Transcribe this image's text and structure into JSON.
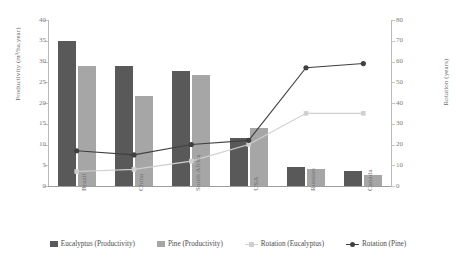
{
  "chart_data": {
    "type": "bar",
    "title": "",
    "subtitle": "",
    "categories": [
      "Brazil",
      "China",
      "South Africa",
      "USA",
      "Russian",
      "Canada"
    ],
    "xlabel": "",
    "ylabel": "Productivity (m³/ha.year)",
    "y2label": "Rotation (years)",
    "ylim": [
      0,
      40
    ],
    "y2lim": [
      0,
      80
    ],
    "yticks": [
      0,
      5,
      10,
      15,
      20,
      25,
      30,
      35,
      40
    ],
    "y2ticks": [
      0,
      10,
      20,
      30,
      40,
      50,
      60,
      70,
      80
    ],
    "grid": false,
    "legend_position": "bottom",
    "series": [
      {
        "name": "Eucalyptus (Productivity)",
        "kind": "bar",
        "axis": "left",
        "color": "#595959",
        "values": [
          35,
          28.8,
          27.8,
          11.6,
          4.7,
          3.6
        ]
      },
      {
        "name": "Pine (Productivity)",
        "kind": "bar",
        "axis": "left",
        "color": "#a6a6a6",
        "values": [
          28.8,
          21.8,
          26.7,
          13.9,
          4.2,
          2.6
        ]
      },
      {
        "name": "Rotation (Eucalyptus)",
        "kind": "line",
        "axis": "right",
        "color": "#d0d0d0",
        "marker": "square",
        "values": [
          7,
          8,
          12,
          20,
          35,
          35
        ]
      },
      {
        "name": "Rotation (Pine)",
        "kind": "line",
        "axis": "right",
        "color": "#404040",
        "marker": "circle",
        "values": [
          17,
          15,
          20,
          22,
          57,
          59
        ]
      }
    ]
  },
  "colors": {
    "eucalyptus_bar": "#595959",
    "pine_bar": "#a6a6a6",
    "rotation_eucalyptus_line": "#d0d0d0",
    "rotation_pine_line": "#404040",
    "axis": "#b9b9b9",
    "text": "#6e6e6e",
    "background": "#ffffff"
  },
  "axes": {
    "left_title": "Productivity (m³/ha.year)",
    "right_title": "Rotation (years)",
    "left_ticks": [
      "0",
      "5",
      "10",
      "15",
      "20",
      "25",
      "30",
      "35",
      "40"
    ],
    "right_ticks": [
      "0",
      "10",
      "20",
      "30",
      "40",
      "50",
      "60",
      "70",
      "80"
    ]
  },
  "legend": {
    "items": [
      {
        "label": "Eucalyptus (Productivity)",
        "marker": "bar",
        "color": "#595959"
      },
      {
        "label": "Pine (Productivity)",
        "marker": "bar",
        "color": "#a6a6a6"
      },
      {
        "label": "Rotation (Eucalyptus)",
        "marker": "square-line",
        "color": "#d0d0d0"
      },
      {
        "label": "Rotation (Pine)",
        "marker": "circle-line",
        "color": "#404040"
      }
    ]
  }
}
